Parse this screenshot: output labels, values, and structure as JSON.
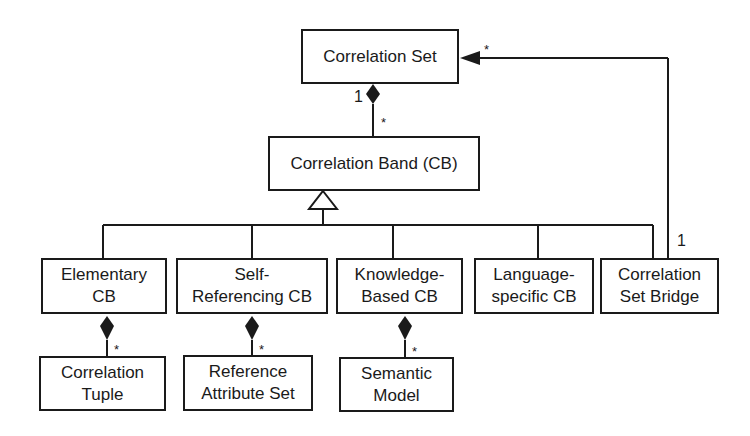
{
  "diagram": {
    "type": "UML class diagram",
    "nodes": {
      "correlation_set": "Correlation Set",
      "correlation_band": "Correlation Band (CB)",
      "elementary_cb_1": "Elementary",
      "elementary_cb_2": "CB",
      "self_ref_cb_1": "Self-",
      "self_ref_cb_2": "Referencing CB",
      "knowledge_cb_1": "Knowledge-",
      "knowledge_cb_2": "Based CB",
      "language_cb_1": "Language-",
      "language_cb_2": "specific CB",
      "bridge_1": "Correlation",
      "bridge_2": "Set Bridge",
      "tuple_1": "Correlation",
      "tuple_2": "Tuple",
      "ref_attr_1": "Reference",
      "ref_attr_2": "Attribute Set",
      "semantic_1": "Semantic",
      "semantic_2": "Model"
    },
    "multiplicities": {
      "set_band_one": "1",
      "set_band_many": "*",
      "bridge_one": "1",
      "bridge_set_many": "*",
      "tuple_many": "*",
      "ref_attr_many": "*",
      "semantic_many": "*"
    },
    "edges": [
      {
        "from": "Correlation Set",
        "to": "Correlation Band (CB)",
        "kind": "composition",
        "mult": [
          "1",
          "*"
        ]
      },
      {
        "from": "Elementary CB",
        "to": "Correlation Band (CB)",
        "kind": "generalization"
      },
      {
        "from": "Self-Referencing CB",
        "to": "Correlation Band (CB)",
        "kind": "generalization"
      },
      {
        "from": "Knowledge-Based CB",
        "to": "Correlation Band (CB)",
        "kind": "generalization"
      },
      {
        "from": "Language-specific CB",
        "to": "Correlation Band (CB)",
        "kind": "generalization"
      },
      {
        "from": "Correlation Set Bridge",
        "to": "Correlation Band (CB)",
        "kind": "generalization"
      },
      {
        "from": "Correlation Set Bridge",
        "to": "Correlation Set",
        "kind": "association",
        "mult": [
          "1",
          "*"
        ]
      },
      {
        "from": "Elementary CB",
        "to": "Correlation Tuple",
        "kind": "composition",
        "mult": [
          "",
          "*"
        ]
      },
      {
        "from": "Self-Referencing CB",
        "to": "Reference Attribute Set",
        "kind": "composition",
        "mult": [
          "",
          "*"
        ]
      },
      {
        "from": "Knowledge-Based CB",
        "to": "Semantic Model",
        "kind": "composition",
        "mult": [
          "",
          "*"
        ]
      }
    ]
  }
}
